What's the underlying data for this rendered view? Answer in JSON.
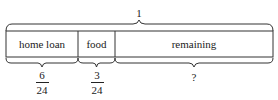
{
  "diagram": {
    "total_label": "1",
    "segments": [
      {
        "label": "home loan",
        "fraction": {
          "numerator": "6",
          "denominator": "24"
        }
      },
      {
        "label": "food",
        "fraction": {
          "numerator": "3",
          "denominator": "24"
        }
      },
      {
        "label": "remaining",
        "unknown": "?"
      }
    ]
  }
}
